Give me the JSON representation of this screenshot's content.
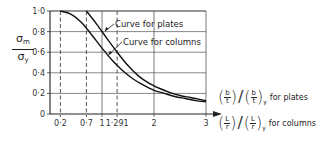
{
  "chart_data": {
    "type": "line",
    "title": "",
    "ylabel": "σm / σy",
    "ylabel_parts": {
      "numerator": "σ",
      "numerator_sub": "m",
      "denominator": "σ",
      "denominator_sub": "y"
    },
    "xlabel_lines": [
      {
        "expr_num": "b",
        "expr_den": "t",
        "sub": "y",
        "suffix": "for plates"
      },
      {
        "expr_num": "L",
        "expr_den": "r",
        "sub": "y",
        "suffix": "for columns"
      }
    ],
    "xlim": [
      0,
      3
    ],
    "ylim": [
      0,
      1.0
    ],
    "grid": true,
    "x_ticks": [
      {
        "value": 0.2,
        "label": "0·2",
        "style": "dashed"
      },
      {
        "value": 0.7,
        "label": "0·7",
        "style": "dashed"
      },
      {
        "value": 1,
        "label": "1",
        "style": "solid"
      },
      {
        "value": 1.291,
        "label": "1·291",
        "style": "dashed"
      },
      {
        "value": 2,
        "label": "2",
        "style": "solid"
      },
      {
        "value": 3,
        "label": "3",
        "style": "solid"
      }
    ],
    "y_ticks": [
      {
        "value": 0,
        "label": "0"
      },
      {
        "value": 0.2,
        "label": "0·2"
      },
      {
        "value": 0.4,
        "label": "0·4"
      },
      {
        "value": 0.6,
        "label": "0·6"
      },
      {
        "value": 0.8,
        "label": "0·8"
      },
      {
        "value": 1.0,
        "label": "1·0"
      }
    ],
    "series": [
      {
        "name": "Curve for columns",
        "x": [
          0.2,
          0.4,
          0.6,
          0.8,
          1.0,
          1.2,
          1.4,
          1.6,
          1.8,
          2.0,
          2.2,
          2.4,
          2.6,
          2.8,
          3.0
        ],
        "y": [
          1.0,
          0.97,
          0.89,
          0.77,
          0.64,
          0.52,
          0.42,
          0.34,
          0.28,
          0.23,
          0.2,
          0.17,
          0.15,
          0.13,
          0.12
        ]
      },
      {
        "name": "Curve for plates",
        "x": [
          0.7,
          0.9,
          1.1,
          1.291,
          1.5,
          1.7,
          1.9,
          2.1,
          2.3,
          2.5,
          2.7,
          2.9,
          3.0
        ],
        "y": [
          1.0,
          0.87,
          0.73,
          0.6,
          0.47,
          0.37,
          0.3,
          0.25,
          0.21,
          0.18,
          0.16,
          0.14,
          0.13
        ]
      }
    ],
    "annotations": [
      {
        "text": "Curve for plates",
        "points_to_series": "Curve for plates",
        "at": [
          1.05,
          0.8
        ]
      },
      {
        "text": "Curve for columns",
        "points_to_series": "Curve for columns",
        "at": [
          1.12,
          0.57
        ]
      }
    ],
    "legend": "none"
  }
}
